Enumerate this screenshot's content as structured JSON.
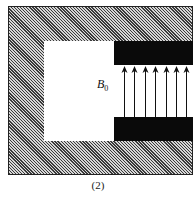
{
  "diagram": {
    "field_label": "B",
    "field_subscript": "0",
    "caption": "(2)",
    "arrow_count": 7,
    "arrow_x_positions": [
      124,
      134,
      145,
      155,
      166,
      176,
      186
    ],
    "arrow_direction": "up",
    "colors": {
      "hatch_dark": "#3a3a3a",
      "hatch_light": "#d6d6d6",
      "pole": "#0a0a0a",
      "cavity": "#ffffff"
    }
  }
}
